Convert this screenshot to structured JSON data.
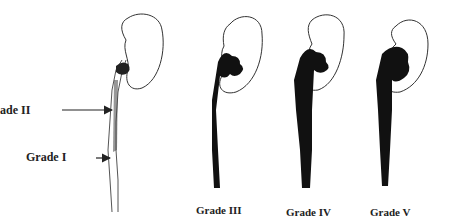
{
  "diagram": {
    "labels": {
      "grade_i": "Grade I",
      "grade_ii": "ade II",
      "grade_iii": "Grade III",
      "grade_iv": "Grade IV",
      "grade_v": "Grade V"
    },
    "colors": {
      "fill": "#111111",
      "outline": "#333333",
      "background": "#ffffff"
    }
  }
}
